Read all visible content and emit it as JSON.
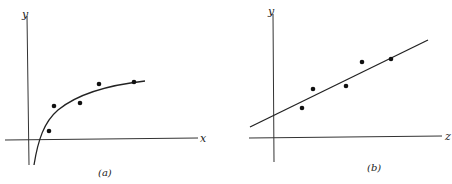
{
  "chart_data": [
    {
      "type": "scatter",
      "panel_label": "(a)",
      "xlabel": "x",
      "ylabel": "y",
      "fit": "logarithmic curve",
      "grid": false,
      "points": [
        {
          "x": 49,
          "y": 131
        },
        {
          "x": 54,
          "y": 106
        },
        {
          "x": 80,
          "y": 103
        },
        {
          "x": 99,
          "y": 84
        },
        {
          "x": 134,
          "y": 82
        }
      ],
      "curve": "M34,165 C38,140 44,122 58,110 C75,96 100,86 145,81"
    },
    {
      "type": "scatter",
      "panel_label": "(b)",
      "xlabel": "z",
      "ylabel": "y",
      "fit": "straight line",
      "grid": false,
      "points": [
        {
          "x": 302,
          "y": 108
        },
        {
          "x": 313,
          "y": 89
        },
        {
          "x": 346,
          "y": 86
        },
        {
          "x": 362,
          "y": 62
        },
        {
          "x": 391,
          "y": 59
        }
      ],
      "line": {
        "x1": 250,
        "y1": 127,
        "x2": 428,
        "y2": 40
      }
    }
  ],
  "panels": {
    "a": {
      "caption": "(a)",
      "x_axis_label": "x",
      "y_axis_label": "y"
    },
    "b": {
      "caption": "(b)",
      "x_axis_label": "z",
      "y_axis_label": "y"
    }
  },
  "colors": {
    "ink": "#222222",
    "background": "#ffffff"
  }
}
